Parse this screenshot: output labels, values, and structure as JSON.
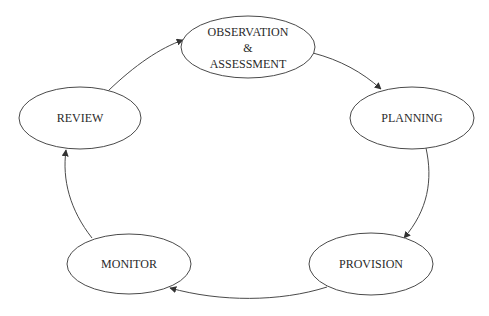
{
  "diagram": {
    "type": "cycle",
    "nodes": [
      {
        "id": "observation",
        "lines": [
          "OBSERVATION",
          "&",
          "ASSESSMENT"
        ],
        "cx": 248,
        "cy": 47,
        "rx": 67,
        "ry": 31
      },
      {
        "id": "planning",
        "lines": [
          "PLANNING"
        ],
        "cx": 412,
        "cy": 118,
        "rx": 62,
        "ry": 31
      },
      {
        "id": "provision",
        "lines": [
          "PROVISION"
        ],
        "cx": 371,
        "cy": 264,
        "rx": 62,
        "ry": 31
      },
      {
        "id": "monitor",
        "lines": [
          "MONITOR"
        ],
        "cx": 129,
        "cy": 264,
        "rx": 62,
        "ry": 30
      },
      {
        "id": "review",
        "lines": [
          "REVIEW"
        ],
        "cx": 80,
        "cy": 118,
        "rx": 61,
        "ry": 31
      }
    ],
    "edges": [
      {
        "from": "observation",
        "to": "planning"
      },
      {
        "from": "planning",
        "to": "provision"
      },
      {
        "from": "provision",
        "to": "monitor"
      },
      {
        "from": "monitor",
        "to": "review"
      },
      {
        "from": "review",
        "to": "observation"
      }
    ],
    "colors": {
      "stroke": "#4a4a4a",
      "text": "#2a2a2a",
      "background": "#ffffff"
    }
  }
}
